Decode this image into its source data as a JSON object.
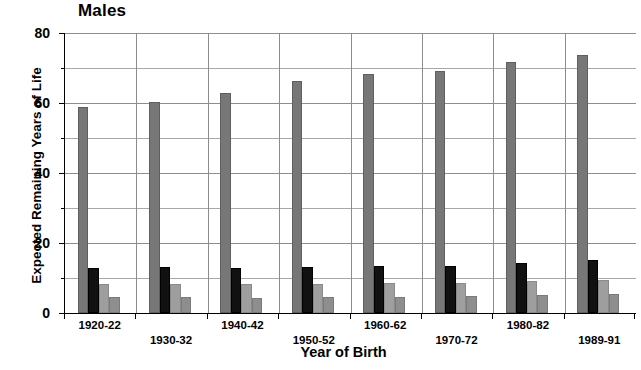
{
  "chart_data": {
    "type": "bar",
    "title": "Males",
    "xlabel": "Year of Birth",
    "ylabel": "Expected Remaining Years of Life",
    "categories": [
      "1920-22",
      "1930-32",
      "1940-42",
      "1950-52",
      "1960-62",
      "1970-72",
      "1980-82",
      "1989-91"
    ],
    "ylim": [
      0,
      80
    ],
    "yticks": [
      0,
      20,
      40,
      60,
      80
    ],
    "ytick_labels": [
      "0",
      "20",
      "40",
      "60",
      "80"
    ],
    "yticks_minor": [
      10,
      30,
      50,
      70
    ],
    "grid": "horizontal gridlines every 10 units, vertical separators between category groups",
    "legend": "none",
    "series": [
      {
        "name": "At birth",
        "color": "#777777",
        "values": [
          58.8,
          60.2,
          63.0,
          66.2,
          68.3,
          69.2,
          71.6,
          73.6
        ]
      },
      {
        "name": "At age 65",
        "color": "#111111",
        "values": [
          13.0,
          13.1,
          12.8,
          13.2,
          13.4,
          13.5,
          14.3,
          15.1
        ]
      },
      {
        "name": "At age 75",
        "color": "#9e9e9e",
        "values": [
          8.4,
          8.4,
          8.3,
          8.4,
          8.5,
          8.7,
          9.1,
          9.4
        ]
      },
      {
        "name": "At age 85",
        "color": "#8e8e8e",
        "values": [
          4.6,
          4.6,
          4.4,
          4.5,
          4.7,
          4.9,
          5.2,
          5.3
        ]
      }
    ]
  }
}
